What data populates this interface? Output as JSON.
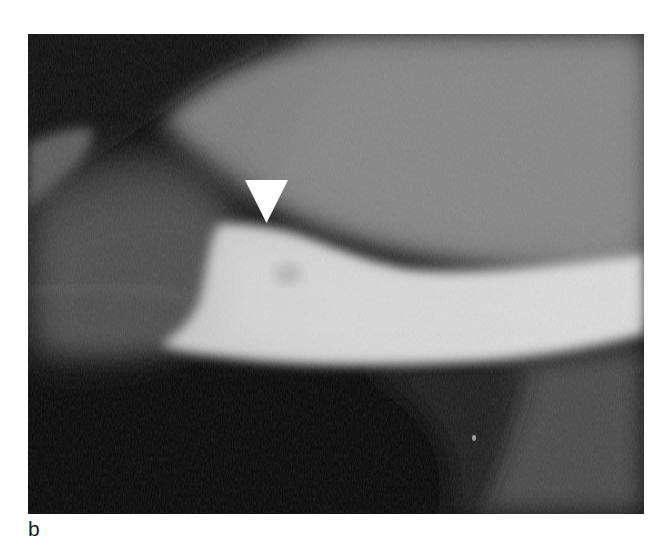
{
  "figure": {
    "panel_label": "b",
    "image_type": "radiograph",
    "annotation": {
      "icon": "arrowhead-down-icon",
      "color": "#ffffff"
    },
    "colors": {
      "background": "#ffffff",
      "dark_field": "#050505",
      "soft_tissue": "#7a7a7a",
      "bone_bright": "#d4d4d4"
    }
  }
}
